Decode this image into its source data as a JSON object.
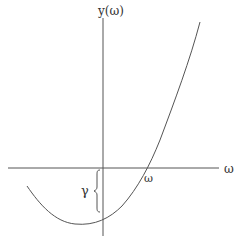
{
  "diagram": {
    "title": "",
    "axes": {
      "y_label": "y(ω)",
      "x_label": "ω"
    },
    "annotations": {
      "root_label": "ω",
      "intercept_label": "γ"
    },
    "curve": {
      "description": "upward-opening convex curve with minimum left of the y-axis, negative y-intercept (offset γ below the x-axis), crossing the x-axis at a positive root ω",
      "color": "#555555"
    },
    "colors": {
      "axis": "#555555",
      "curve": "#555555",
      "text": "#333333",
      "background": "#ffffff"
    }
  }
}
